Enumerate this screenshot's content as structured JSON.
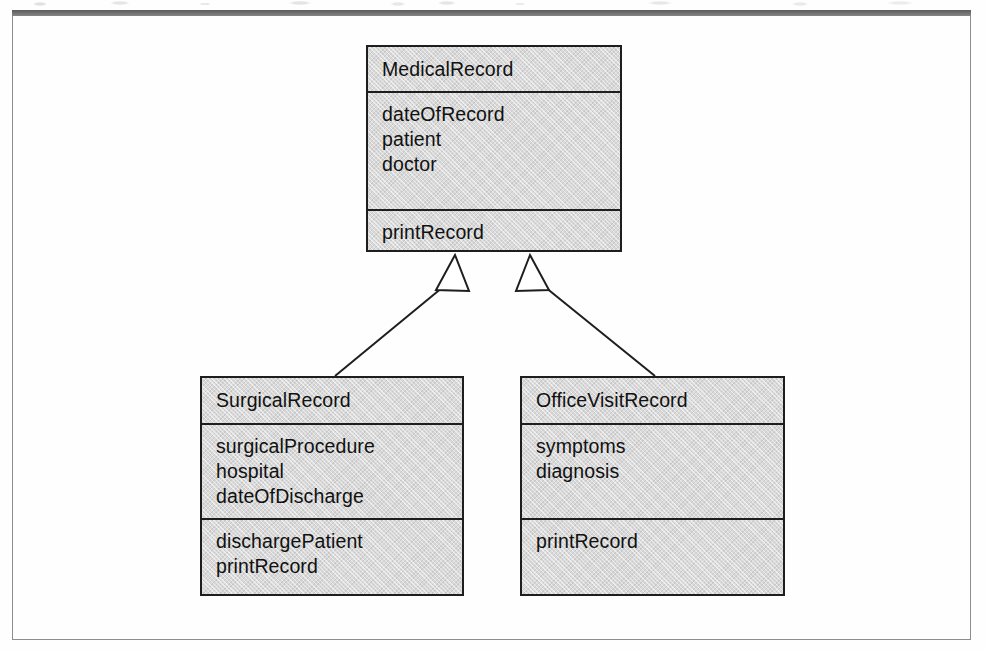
{
  "figure": {
    "kind": "uml-class-diagram",
    "colors": {
      "class_fill": "#d9d9d9",
      "class_border": "#1e1e1e",
      "frame_border": "#8d8d8d",
      "top_rule": "#6e6e6e",
      "page_background": "#ffffff",
      "text": "#111111"
    }
  },
  "classes": {
    "medical_record": {
      "name": "MedicalRecord",
      "attributes": [
        "dateOfRecord",
        "patient",
        "doctor"
      ],
      "operations": [
        "printRecord"
      ]
    },
    "surgical_record": {
      "name": "SurgicalRecord",
      "attributes": [
        "surgicalProcedure",
        "hospital",
        "dateOfDischarge"
      ],
      "operations": [
        "dischargePatient",
        "printRecord"
      ]
    },
    "office_visit_record": {
      "name": "OfficeVisitRecord",
      "attributes": [
        "symptoms",
        "diagnosis"
      ],
      "operations": [
        "printRecord"
      ]
    }
  },
  "relationships": [
    {
      "type": "generalization",
      "source": "SurgicalRecord",
      "target": "MedicalRecord",
      "arrowhead": "hollow-triangle"
    },
    {
      "type": "generalization",
      "source": "OfficeVisitRecord",
      "target": "MedicalRecord",
      "arrowhead": "hollow-triangle"
    }
  ]
}
